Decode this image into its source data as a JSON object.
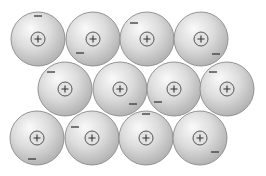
{
  "diagram": {
    "ion_radius": 27,
    "core_radius": 7,
    "ion_symbol": "+",
    "electron_symbol": "−",
    "colors": {
      "background": "#ffffff",
      "sphere_highlight": "#fafafa",
      "sphere_mid": "#dcdcdc",
      "sphere_edge": "#b4b4b4",
      "sphere_outline": "#8a8a8a",
      "core_fill": "#e2e2e2",
      "core_outline": "#555555",
      "symbol": "#333333",
      "electron": "#444444"
    },
    "ions": [
      {
        "row": 1,
        "cx": 38,
        "cy": 39,
        "electron": {
          "x": 38,
          "y": 16
        }
      },
      {
        "row": 1,
        "cx": 93,
        "cy": 39,
        "electron": {
          "x": 80,
          "y": 53
        }
      },
      {
        "row": 1,
        "cx": 147,
        "cy": 39,
        "electron": {
          "x": 134,
          "y": 23
        }
      },
      {
        "row": 1,
        "cx": 201,
        "cy": 39,
        "electron": {
          "x": 216,
          "y": 54
        }
      },
      {
        "row": 2,
        "cx": 65,
        "cy": 89,
        "electron": {
          "x": 51,
          "y": 72
        }
      },
      {
        "row": 2,
        "cx": 120,
        "cy": 89,
        "electron": {
          "x": 133,
          "y": 104
        }
      },
      {
        "row": 2,
        "cx": 174,
        "cy": 89,
        "electron": {
          "x": 158,
          "y": 102
        }
      },
      {
        "row": 2,
        "cx": 227,
        "cy": 89,
        "electron": {
          "x": 213,
          "y": 72
        }
      },
      {
        "row": 3,
        "cx": 37,
        "cy": 138,
        "electron": {
          "x": 32,
          "y": 159
        }
      },
      {
        "row": 3,
        "cx": 92,
        "cy": 138,
        "electron": {
          "x": 75,
          "y": 127
        }
      },
      {
        "row": 3,
        "cx": 146,
        "cy": 138,
        "electron": {
          "x": 146,
          "y": 114
        }
      },
      {
        "row": 3,
        "cx": 200,
        "cy": 138,
        "electron": {
          "x": 215,
          "y": 152
        }
      }
    ]
  }
}
